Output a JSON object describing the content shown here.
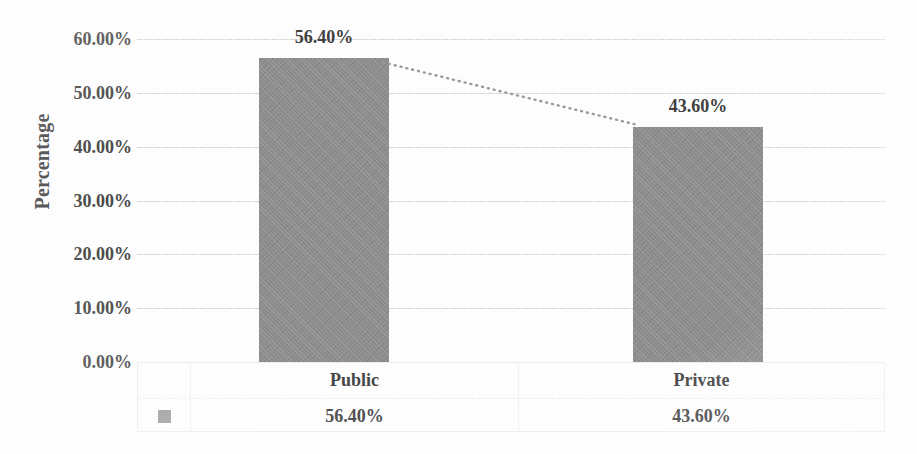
{
  "chart_data": {
    "type": "bar",
    "title": "",
    "subtitle": "",
    "xlabel": "",
    "ylabel": "Percentage",
    "categories": [
      "Public",
      "Private"
    ],
    "values": [
      56.4,
      43.6
    ],
    "value_labels": [
      "56.40%",
      "43.60%"
    ],
    "ylim": [
      0,
      60
    ],
    "ytick_values": [
      60,
      50,
      40,
      30,
      20,
      10,
      0
    ],
    "ytick_labels": [
      "60.00%",
      "50.00%",
      "40.00%",
      "30.00%",
      "20.00%",
      "10.00%",
      "0.00%"
    ],
    "grid": true,
    "grid_style": "dotted",
    "legend": {
      "position": "table-left",
      "entries": [
        {
          "label": "",
          "swatch": "legend-swatch",
          "color": "#8d8d8d"
        }
      ]
    },
    "series": [
      {
        "name": "Percentage",
        "values": [
          56.4,
          43.6
        ],
        "color": "#8d8d8d",
        "has_trendline": true,
        "trendline_style": "dotted"
      }
    ],
    "data_table": {
      "show": true,
      "header_row": [
        "Public",
        "Private"
      ],
      "rows": [
        {
          "swatch": true,
          "cells": [
            "56.40%",
            "43.60%"
          ]
        }
      ]
    },
    "colors": {
      "bar": "#8d8d8d",
      "gridline": "#d8d8d8",
      "text": "#474747",
      "background": "#fdfdfd",
      "table_border": "#ececec"
    }
  }
}
